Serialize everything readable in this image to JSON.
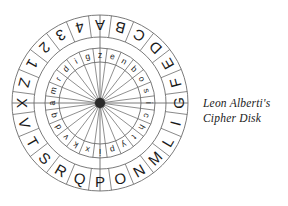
{
  "figure": {
    "title": "Leon Alberti's Cipher Disk",
    "caption_line_1": "Leon Alberti's",
    "caption_line_2": "Cipher Disk",
    "outer_ring": {
      "count": 24,
      "labels": [
        "A",
        "B",
        "C",
        "D",
        "E",
        "F",
        "G",
        "I",
        "L",
        "M",
        "N",
        "O",
        "P",
        "Q",
        "R",
        "S",
        "T",
        "V",
        "X",
        "Z",
        "1",
        "2",
        "3",
        "4"
      ]
    },
    "inner_ring": {
      "count": 24,
      "labels": [
        "z",
        "e",
        "n",
        "b",
        "o",
        "s",
        "i",
        "c",
        "h",
        "t",
        "y",
        "p",
        "i",
        "x",
        "k",
        "v",
        "d",
        "q",
        "a",
        "m",
        "r",
        "d",
        "i",
        "g"
      ]
    },
    "colors": {
      "line": "#6b6b6b",
      "text": "#1a1a1a",
      "hub": "#2a2a2a",
      "background": "#ffffff"
    },
    "geometry": {
      "center_x": 100,
      "center_y": 105,
      "outer_radius": 88,
      "outer_ring_inner_radius": 66,
      "inner_ring_outer_radius": 55,
      "inner_ring_inner_radius": 41,
      "hub_radius": 5
    }
  }
}
